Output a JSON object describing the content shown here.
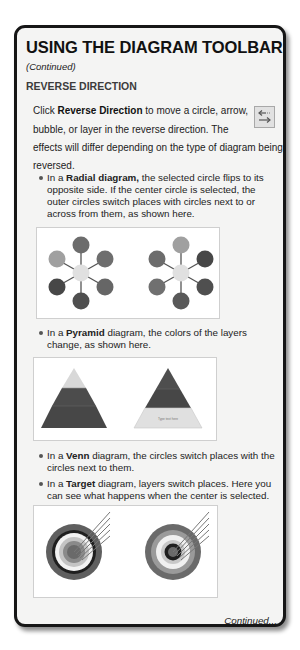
{
  "page": {
    "title": "USING THE DIAGRAM TOOLBAR",
    "subtitle": "(Continued)",
    "section_heading": "REVERSE DIRECTION",
    "intro": {
      "line1_pre": "Click ",
      "line1_bold": "Reverse Direction",
      "line1_post": " to move a circle, arrow,",
      "line2": "bubble, or layer in the reverse direction. The",
      "line3": "effects will differ depending on the type of diagram being",
      "line4": "reversed."
    },
    "toolbar_icon": {
      "name": "reverse-direction-icon",
      "glyph_top": "←",
      "glyph_bottom": "→"
    },
    "bullets": [
      {
        "pre": "In a ",
        "bold": "Radial diagram,",
        "lines": [
          " the selected circle flips to its",
          "opposite side. If the center circle is selected, the",
          "outer circles switch places with circles next to or",
          "across from them, as shown here."
        ]
      },
      {
        "pre": "In a ",
        "bold": "Pyramid",
        "lines": [
          " diagram, the colors of the layers",
          "change, as shown here."
        ]
      },
      {
        "pre": "In a ",
        "bold": "Venn",
        "lines": [
          " diagram, the circles switch places with the",
          "circles next to them."
        ]
      },
      {
        "pre": "In a ",
        "bold": "Target",
        "lines": [
          " diagram, layers switch places. Here you",
          "can see what happens when the center is selected."
        ]
      }
    ],
    "figures": {
      "radial": {
        "caption": "Radial diagram before and after reverse direction"
      },
      "pyramid": {
        "caption": "Pyramid diagram before and after reverse direction",
        "layer_label": "Type text here"
      },
      "target": {
        "caption": "Target diagram before and after reverse direction"
      }
    },
    "footer": "Continued..."
  },
  "colors": {
    "card_border": "#161616",
    "card_bg": "#f4f4f3",
    "circle_light": "#9a9a9a",
    "circle_mid": "#6e6e6e",
    "circle_dark": "#4a4a4a",
    "center": "#e2e2e2"
  }
}
